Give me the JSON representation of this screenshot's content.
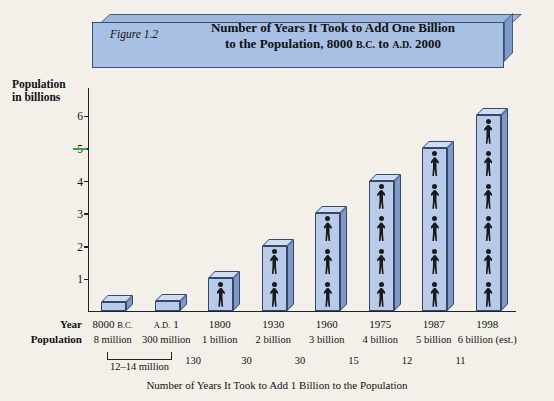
{
  "figure": {
    "label": "Figure 1.2",
    "title_line1": "Number of Years It Took to Add One Billion",
    "title_line2_a": "to the Population, 8000 ",
    "title_line2_bc": "B.C.",
    "title_line2_b": " to ",
    "title_line2_ad": "A.D.",
    "title_line2_c": " 2000",
    "y_axis_label_line1": "Population",
    "y_axis_label_line2": "in billions",
    "row_label_year": "Year",
    "row_label_population": "Population",
    "footnote": "Number of Years It Took to Add 1 Billion to the Population",
    "colors": {
      "bar_face": "#b8cce9",
      "bar_side": "#7d99c7",
      "bar_top": "#cfdcf1",
      "banner_face": "#a8c0e4",
      "outline": "#36476a",
      "green_tick": "#3aa03a"
    }
  },
  "chart_data": {
    "type": "bar",
    "title": "Number of Years It Took to Add One Billion to the Population, 8000 B.C. to A.D. 2000",
    "xlabel": "Number of Years It Took to Add 1 Billion to the Population",
    "ylabel": "Population in billions",
    "ylim": [
      0,
      6.5
    ],
    "yticks": [
      1,
      2,
      3,
      4,
      5,
      6
    ],
    "grid": false,
    "legend": "none",
    "categories": [
      "8000 B.C.",
      "A.D. 1",
      "1800",
      "1930",
      "1960",
      "1975",
      "1987",
      "1998"
    ],
    "values": [
      0.008,
      0.3,
      1,
      2,
      3,
      4,
      5,
      6
    ],
    "year_labels": [
      {
        "main": "8000",
        "sc": "B.C."
      },
      {
        "main": "A.D.",
        "sc": "",
        "pre_sc": "A.D.",
        "after": "1"
      },
      {
        "main": "1800",
        "sc": ""
      },
      {
        "main": "1930",
        "sc": ""
      },
      {
        "main": "1960",
        "sc": ""
      },
      {
        "main": "1975",
        "sc": ""
      },
      {
        "main": "1987",
        "sc": ""
      },
      {
        "main": "1998",
        "sc": ""
      }
    ],
    "year_cells": [
      "8000 B.C.",
      "A.D. 1",
      "1800",
      "1930",
      "1960",
      "1975",
      "1987",
      "1998"
    ],
    "population_cells": [
      "8 million",
      "300 million",
      "1 billion",
      "2 billion",
      "3 billion",
      "4 billion",
      "5 billion",
      "6 billion (est.)"
    ],
    "interval_labels": [
      "12–14 million",
      "130",
      "30",
      "30",
      "15",
      "12",
      "11"
    ],
    "people_icon_counts": [
      0,
      0,
      1,
      2,
      3,
      4,
      5,
      6
    ]
  }
}
